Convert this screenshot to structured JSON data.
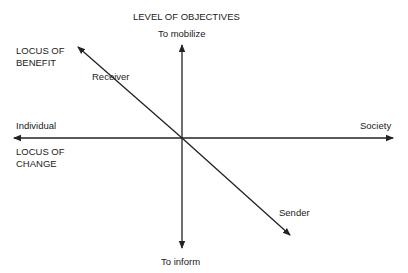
{
  "diagram": {
    "top_axis_title": "LEVEL OF OBJECTIVES",
    "axes": {
      "vertical": {
        "top_label": "To mobilize",
        "bottom_label": "To inform"
      },
      "horizontal": {
        "left_label": "Individual",
        "right_label": "Society"
      },
      "diagonal": {
        "upper_label": "Receiver",
        "lower_label": "Sender"
      }
    },
    "locus_of_benefit": {
      "line1": "LOCUS OF",
      "line2": "BENEFIT"
    },
    "locus_of_change": {
      "line1": "LOCUS OF",
      "line2": "CHANGE"
    },
    "colors": {
      "line": "#222222",
      "background": "#ffffff"
    }
  }
}
